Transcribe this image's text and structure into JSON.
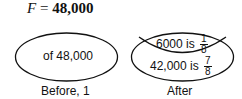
{
  "title": {
    "variable": "F",
    "equals": "=",
    "value": "48,000"
  },
  "before": {
    "content": "of 48,000",
    "caption": "Before, 1"
  },
  "after": {
    "top": {
      "text": "6000 is",
      "numerator": "1",
      "denominator": "8"
    },
    "bottom": {
      "text": "42,000 is",
      "numerator": "7",
      "denominator": "8"
    },
    "caption": "After"
  },
  "colors": {
    "stroke": "#111111",
    "background": "#ffffff"
  }
}
